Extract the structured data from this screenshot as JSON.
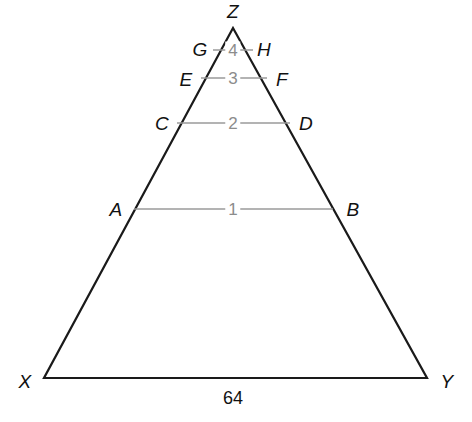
{
  "figure": {
    "type": "geometry-diagram",
    "shape": "triangle",
    "background_color": "#ffffff",
    "outline_color": "#1a1a1a",
    "segment_color": "#9a9a9a",
    "label_color": "#111111",
    "number_color": "#8c8c8c"
  },
  "vertices": [
    {
      "label": "Z",
      "x": 233,
      "y": 28,
      "label_x": 233,
      "label_y": 11
    },
    {
      "label": "X",
      "x": 44,
      "y": 378,
      "label_x": 25,
      "label_y": 381
    },
    {
      "label": "Y",
      "x": 427,
      "y": 378,
      "label_x": 447,
      "label_y": 381
    }
  ],
  "sides": [
    {
      "name": "ZX",
      "from": "Z",
      "to": "X"
    },
    {
      "name": "ZY",
      "from": "Z",
      "to": "Y"
    },
    {
      "name": "XY",
      "from": "X",
      "to": "Y"
    }
  ],
  "segments": [
    {
      "number": "4",
      "left_label": "G",
      "right_label": "H",
      "y": 50,
      "x1": 213,
      "x2": 253,
      "left_label_x": 200,
      "left_label_y": 49,
      "right_label_x": 264,
      "right_label_y": 49,
      "number_x": 233,
      "number_y": 50
    },
    {
      "number": "3",
      "left_label": "E",
      "right_label": "F",
      "y": 78,
      "x1": 201,
      "x2": 267,
      "left_label_x": 186,
      "left_label_y": 79,
      "right_label_x": 282,
      "right_label_y": 79,
      "number_x": 233,
      "number_y": 78
    },
    {
      "number": "2",
      "left_label": "C",
      "right_label": "D",
      "y": 123,
      "x1": 177,
      "x2": 290,
      "left_label_x": 162,
      "left_label_y": 123,
      "right_label_x": 306,
      "right_label_y": 123,
      "number_x": 233,
      "number_y": 123
    },
    {
      "number": "1",
      "left_label": "A",
      "right_label": "B",
      "y": 209,
      "x1": 134,
      "x2": 333,
      "left_label_x": 116,
      "left_label_y": 209,
      "right_label_x": 353,
      "right_label_y": 209,
      "number_x": 233,
      "number_y": 209
    }
  ],
  "base_measure": {
    "value": "64",
    "x": 233,
    "y": 398
  },
  "chart_data": {
    "type": "diagram",
    "title": "",
    "triangle": [
      "X",
      "Y",
      "Z"
    ],
    "parallel_segments": [
      "GH",
      "EF",
      "CD",
      "AB"
    ],
    "segment_numbers": [
      "4",
      "3",
      "2",
      "1"
    ],
    "known_length": {
      "segment": "XY",
      "value": 64
    }
  }
}
